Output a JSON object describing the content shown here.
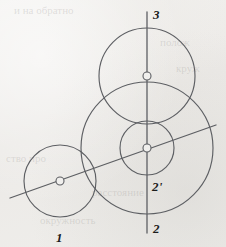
{
  "figure": {
    "background_color": "#f0efed",
    "stroke_color": "#5d5f63",
    "label_color": "#1c1c1c",
    "width": 226,
    "height": 247,
    "labels": [
      {
        "id": "label-3",
        "text": "3",
        "x": 153,
        "y": 8,
        "describes": "upper circle on vertical line"
      },
      {
        "id": "label-2p",
        "text": "2'",
        "x": 152,
        "y": 180,
        "describes": "inner small circle, center on intersection"
      },
      {
        "id": "label-2",
        "text": "2",
        "x": 153,
        "y": 222,
        "describes": "large lower circle"
      },
      {
        "id": "label-1",
        "text": "1",
        "x": 56,
        "y": 231,
        "describes": "small left circle on diagonal line"
      }
    ],
    "circles": [
      {
        "id": "circle-1",
        "label": "1",
        "cx": 60,
        "cy": 181,
        "r": 36
      },
      {
        "id": "circle-2",
        "label": "2",
        "cx": 147,
        "cy": 148,
        "r": 66
      },
      {
        "id": "circle-2-prime",
        "label": "2'",
        "cx": 147,
        "cy": 148,
        "r": 27
      },
      {
        "id": "circle-3",
        "label": "3",
        "cx": 147,
        "cy": 76,
        "r": 48
      }
    ],
    "center_markers": [
      {
        "id": "center-1",
        "cx": 60,
        "cy": 181,
        "r": 4
      },
      {
        "id": "center-2",
        "cx": 147,
        "cy": 148,
        "r": 4
      },
      {
        "id": "center-3",
        "cx": 147,
        "cy": 76,
        "r": 4
      }
    ],
    "lines": [
      {
        "id": "vertical-axis",
        "x1": 147,
        "y1": 12,
        "x2": 147,
        "y2": 233,
        "orientation": "vertical"
      },
      {
        "id": "diagonal-axis",
        "x1": 10,
        "y1": 198,
        "x2": 216,
        "y2": 125,
        "orientation": "diagonal"
      }
    ],
    "bleed_text": [
      {
        "text": "и на обратно",
        "x": 14,
        "y": 4
      },
      {
        "text": "полож",
        "x": 160,
        "y": 36
      },
      {
        "text": "круж",
        "x": 176,
        "y": 62
      },
      {
        "text": "ство про",
        "x": 6,
        "y": 152
      },
      {
        "text": "расстояние",
        "x": 92,
        "y": 186
      },
      {
        "text": "окружность",
        "x": 40,
        "y": 214
      }
    ]
  }
}
